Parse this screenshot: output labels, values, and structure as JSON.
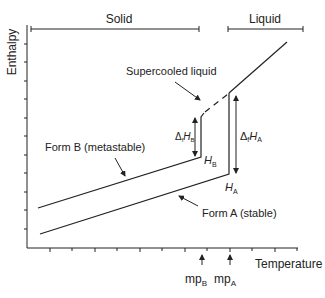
{
  "diagram": {
    "y_axis_label": "Enthalpy",
    "x_axis_label": "Temperature",
    "regions": {
      "solid": "Solid",
      "liquid": "Liquid"
    },
    "labels": {
      "supercooled": "Supercooled liquid",
      "form_b": "Form B (metastable)",
      "form_a": "Form A (stable)",
      "h_b_sym": "H",
      "h_b_sub": "B",
      "h_a_sym": "H",
      "h_a_sub": "A",
      "dh_b_delta": "Δ",
      "dh_b_f": "f",
      "dh_b_h": "H",
      "dh_b_sub": "B",
      "dh_a_delta": "Δ",
      "dh_a_f": "f",
      "dh_a_h": "H",
      "dh_a_sub": "A",
      "mp_b": "mp",
      "mp_b_sub": "B",
      "mp_a": "mp",
      "mp_a_sub": "A"
    },
    "colors": {
      "line": "#222222",
      "background": "#ffffff"
    }
  }
}
